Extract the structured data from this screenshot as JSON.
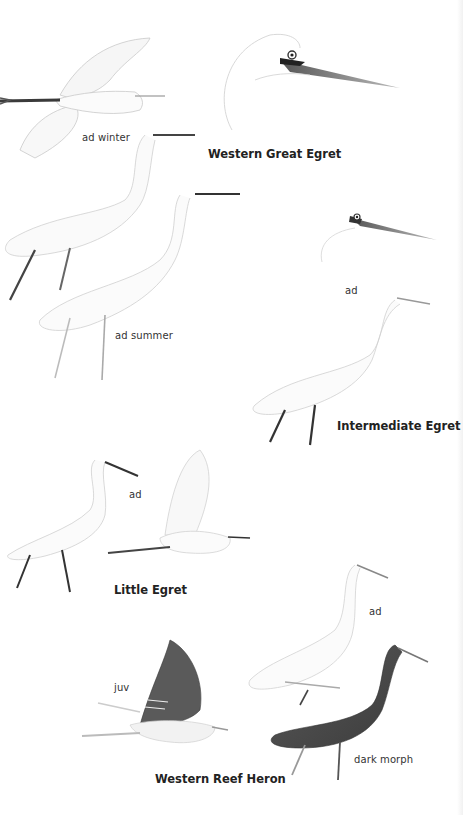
{
  "plate": {
    "species": [
      {
        "name": "Western Great Egret",
        "labels": [
          "ad winter",
          "ad summer"
        ]
      },
      {
        "name": "Intermediate Egret",
        "labels": [
          "ad"
        ]
      },
      {
        "name": "Little Egret",
        "labels": [
          "ad"
        ]
      },
      {
        "name": "Western Reef Heron",
        "labels": [
          "ad",
          "juv",
          "dark morph"
        ]
      }
    ]
  },
  "colors": {
    "background": "#ffffff",
    "sketch_line": "#c8c8c8",
    "bill_dark": "#2a2a2a",
    "bill_grey": "#8a8a8a",
    "dark_morph": "#4a4a4a"
  }
}
